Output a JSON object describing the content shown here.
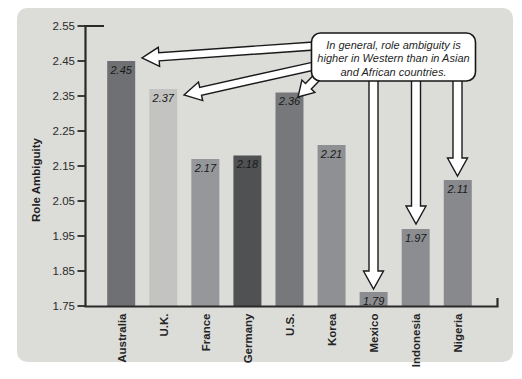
{
  "figure": {
    "page_bg": "#ffffff",
    "panel_bg": "#dcddd9"
  },
  "chart_data": {
    "type": "bar",
    "title": "",
    "xlabel": "",
    "ylabel": "Role Ambiguity",
    "categories": [
      "Australia",
      "U.K.",
      "France",
      "Germany",
      "U.S.",
      "Korea",
      "Mexico",
      "Indonesia",
      "Nigeria"
    ],
    "values": [
      2.45,
      2.37,
      2.17,
      2.18,
      2.36,
      2.21,
      1.79,
      1.97,
      2.11
    ],
    "value_labels": [
      "2.45",
      "2.37",
      "2.17",
      "2.18",
      "2.36",
      "2.21",
      "1.79",
      "1.97",
      "2.11"
    ],
    "bar_colors": [
      "#6e7073",
      "#c3c4c1",
      "#96979a",
      "#505153",
      "#77787b",
      "#8e9093",
      "#8b8d90",
      "#8b8d90",
      "#88898c"
    ],
    "ylim": [
      1.75,
      2.55
    ],
    "ytick_step": 0.1,
    "ytick_labels": [
      "2.55",
      "2.45",
      "2.35",
      "2.25",
      "2.15",
      "2.05",
      "1.95",
      "1.85",
      "1.75"
    ],
    "grid": false,
    "legend": null,
    "annotation": {
      "lines": [
        "In general, role ambiguity is",
        "higher in Western than in Asian",
        "and African countries."
      ],
      "arrow_targets": [
        "Australia",
        "U.K.",
        "U.S.",
        "Mexico",
        "Indonesia",
        "Nigeria"
      ]
    }
  },
  "colors": {
    "axis": "#2a2a2a",
    "tick_text": "#2b2b2b",
    "category_text": "#242424",
    "value_text": "#191919",
    "ylabel_text": "#1f1f1f",
    "callout_bg": "#ffffff",
    "callout_border": "#161616",
    "callout_text": "#1f1f1f",
    "arrow_fill": "#ffffff",
    "arrow_stroke": "#1a1a1a"
  }
}
